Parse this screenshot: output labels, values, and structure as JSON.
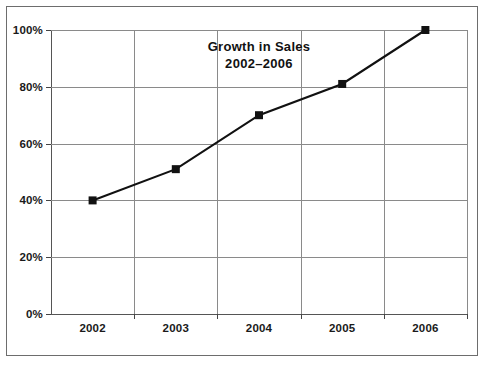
{
  "chart_data": {
    "type": "line",
    "title": "Growth in Sales",
    "subtitle": "2002–2006",
    "xlabel": "",
    "ylabel": "",
    "categories": [
      "2002",
      "2003",
      "2004",
      "2005",
      "2006"
    ],
    "values": [
      40,
      51,
      70,
      81,
      100
    ],
    "value_suffix": "%",
    "ylim": [
      0,
      100
    ],
    "yticks": [
      0,
      20,
      40,
      60,
      80,
      100
    ],
    "ytick_labels": [
      "0%",
      "20%",
      "40%",
      "60%",
      "80%",
      "100%"
    ],
    "grid": {
      "horizontal": true,
      "vertical": true,
      "color": "#8a8a8a"
    },
    "legend": {
      "visible": false,
      "position": "none"
    },
    "series": [
      {
        "name": "Growth in Sales",
        "values": [
          40,
          51,
          70,
          81,
          100
        ],
        "line_color": "#111111",
        "marker": "square",
        "marker_color": "#111111"
      }
    ]
  },
  "figure": {
    "border_color": "#6d6d6d",
    "background": "#ffffff"
  }
}
